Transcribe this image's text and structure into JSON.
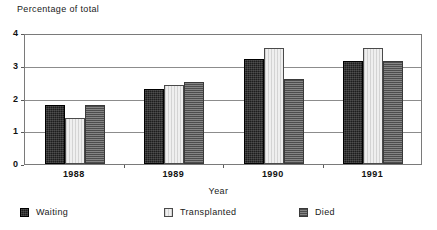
{
  "chart_data": {
    "type": "bar",
    "title": "Percentage of total",
    "xlabel": "Year",
    "ylabel": "",
    "categories": [
      "1988",
      "1989",
      "1990",
      "1991"
    ],
    "series": [
      {
        "name": "Waiting",
        "values": [
          1.8,
          2.3,
          3.2,
          3.15
        ],
        "color": "#1d1d1d",
        "pattern": "dotted-dark"
      },
      {
        "name": "Transplanted",
        "values": [
          1.4,
          2.4,
          3.55,
          3.55
        ],
        "color": "#efefef",
        "pattern": "vertical-lines-light"
      },
      {
        "name": "Died",
        "values": [
          1.8,
          2.5,
          2.6,
          3.15
        ],
        "color": "#6f6f6f",
        "pattern": "horizontal-lines-gray"
      }
    ],
    "ylim": [
      0,
      4
    ],
    "yticks": [
      0,
      1,
      2,
      3,
      4
    ],
    "ytick_labels": [
      "0",
      "1",
      "2",
      "3",
      "4"
    ],
    "grid": true,
    "grid_axis": "y",
    "legend_position": "bottom",
    "background_color": "#ffffff",
    "frame_color": "#7a7a7a"
  },
  "legend": {
    "items": [
      {
        "label": "Waiting"
      },
      {
        "label": "Transplanted"
      },
      {
        "label": "Died"
      }
    ]
  }
}
